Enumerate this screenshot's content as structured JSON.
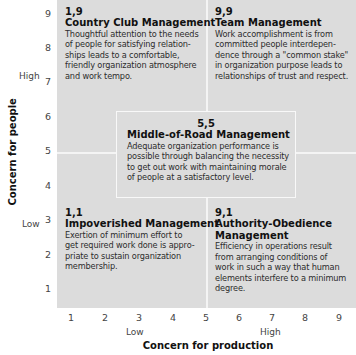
{
  "diagram": {
    "type": "managerial-grid",
    "axes": {
      "x": {
        "title": "Concern for production",
        "ticks": [
          "1",
          "2",
          "3",
          "4",
          "5",
          "6",
          "7",
          "8",
          "9"
        ],
        "low_label": "Low",
        "high_label": "High"
      },
      "y": {
        "title": "Concern for people",
        "ticks": [
          "9",
          "8",
          "7",
          "6",
          "5",
          "4",
          "3",
          "2",
          "1"
        ],
        "low_label": "Low",
        "high_label": "High"
      }
    },
    "styles": {
      "top_left": {
        "coord": "1,9",
        "title": "Country Club Management",
        "description": "Thoughtful attention to the needs\nof people for satisfying relation-\nships leads to a comfortable,\nfriendly organization atmosphere\nand work tempo."
      },
      "top_right": {
        "coord": "9,9",
        "title": "Team Management",
        "description": "Work accomplishment is from\ncommitted people interdepen-\ndence through a \"common stake\"\nin organization purpose leads to\nrelationships of trust and respect."
      },
      "center": {
        "coord": "5,5",
        "title": "Middle-of-Road Management",
        "description": "Adequate organization performance is\npossible through balancing the necessity\nto get out work with maintaining morale\nof people at a satisfactory level."
      },
      "bottom_left": {
        "coord": "1,1",
        "title": "Impoverished Management",
        "description": "Exertion of minimum effort to\nget required work done is appro-\npriate to sustain organization\nmembership."
      },
      "bottom_right": {
        "coord": "9,1",
        "title": "Authority-Obedience\nManagement",
        "description": "Efficiency in operations result\nfrom arranging conditions of\nwork in such a way that human\nelements interfere to a minimum\ndegree."
      }
    },
    "colors": {
      "panel": "#dcdcdc",
      "divider": "#f4f4f4",
      "text": "#2c2c2c",
      "heading": "#111111"
    }
  }
}
